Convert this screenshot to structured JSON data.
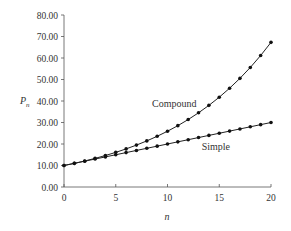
{
  "chart_data": {
    "type": "line",
    "title": "",
    "xlabel": "n",
    "ylabel": "P_n",
    "xlim": [
      0,
      20
    ],
    "ylim": [
      0,
      80
    ],
    "x_ticks": [
      "0",
      "5",
      "10",
      "15",
      "20"
    ],
    "y_ticks": [
      "0.00",
      "10.00",
      "20.00",
      "30.00",
      "40.00",
      "50.00",
      "60.00",
      "70.00",
      "80.00"
    ],
    "grid": false,
    "legend": "inline annotations",
    "x": [
      0,
      1,
      2,
      3,
      4,
      5,
      6,
      7,
      8,
      9,
      10,
      11,
      12,
      13,
      14,
      15,
      16,
      17,
      18,
      19,
      20
    ],
    "series": [
      {
        "name": "Compound",
        "values": [
          10.0,
          11.0,
          12.1,
          13.31,
          14.64,
          16.11,
          17.72,
          19.49,
          21.44,
          23.58,
          25.94,
          28.53,
          31.38,
          34.52,
          37.97,
          41.77,
          45.95,
          50.54,
          55.6,
          61.16,
          67.27
        ]
      },
      {
        "name": "Simple",
        "values": [
          10,
          11,
          12,
          13,
          14,
          15,
          16,
          17,
          18,
          19,
          20,
          21,
          22,
          23,
          24,
          25,
          26,
          27,
          28,
          29,
          30
        ]
      }
    ],
    "annotations": [
      {
        "text": "Compound",
        "x": 8.5,
        "y": 37
      },
      {
        "text": "Simple",
        "x": 13.3,
        "y": 17
      }
    ]
  }
}
